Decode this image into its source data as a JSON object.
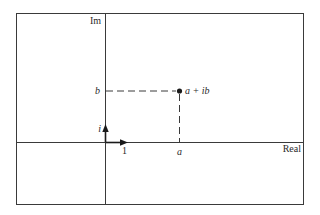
{
  "diagram": {
    "axes": {
      "vertical_label": "Im",
      "horizontal_label": "Real"
    },
    "unit_vectors": {
      "imaginary_unit_label": "i",
      "real_unit_label": "1"
    },
    "point": {
      "label": "a + ib",
      "real_part_label": "a",
      "imag_part_label": "b"
    },
    "colors": {
      "line": "#3a3a3a",
      "text": "#2a2a2a",
      "background": "#ffffff"
    }
  }
}
